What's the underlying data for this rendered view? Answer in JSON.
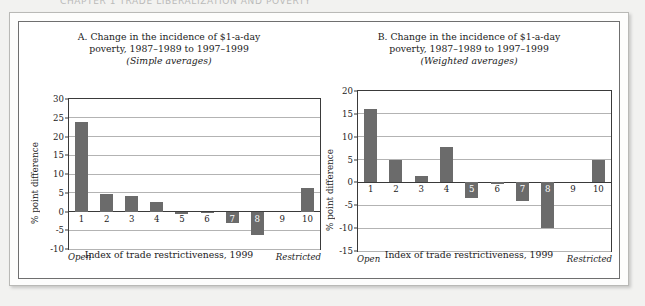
{
  "scan": {
    "cut_off_header": "CHAPTER 1  TRADE LIBERALIZATION AND POVERTY"
  },
  "colors": {
    "bar": "#6b6b6b",
    "axis": "#3a3a3a",
    "grid": "#b3b3b3",
    "text": "#1b1b1b",
    "page_background": "#f2f2f0",
    "panel_background": "#ffffff"
  },
  "panels": [
    {
      "id": "panel-a",
      "title_line1": "A.  Change in the incidence of $1-a-day",
      "title_line2": "poverty, 1987–1989 to 1997–1999",
      "title_line3": "(Simple averages)",
      "xaxis_title": "Index of trade restrictiveness, 1999",
      "left_end_label": "Open",
      "right_end_label": "Restricted"
    },
    {
      "id": "panel-b",
      "title_line1": "B.  Change in the incidence of $1-a-day",
      "title_line2": "poverty, 1987–1989 to 1997–1999",
      "title_line3": "(Weighted averages)",
      "xaxis_title": "Index of trade restrictiveness, 1999",
      "left_end_label": "Open",
      "right_end_label": "Restricted"
    }
  ],
  "chart_data": [
    {
      "type": "bar",
      "id": "chart-a",
      "title": "A. Change in the incidence of $1-a-day poverty, 1987–1989 to 1997–1999 (Simple averages)",
      "subtitle": "(Simple averages)",
      "xlabel": "Index of trade restrictiveness, 1999",
      "ylabel": "% point difference",
      "categories": [
        "1",
        "2",
        "3",
        "4",
        "5",
        "6",
        "7",
        "8",
        "9",
        "10"
      ],
      "values": [
        23.8,
        4.6,
        4.2,
        2.6,
        -0.6,
        -0.2,
        -3.0,
        -6.3,
        0.0,
        6.3
      ],
      "ylim": [
        -10,
        30
      ],
      "yticks": [
        30,
        25,
        20,
        15,
        10,
        5,
        0,
        -5,
        -10
      ],
      "ytick_labels": [
        "30",
        "25",
        "20",
        "15",
        "10",
        "5",
        "0",
        "-5",
        "-10"
      ],
      "grid": true,
      "legend": "none",
      "annotations": {
        "x_axis_left": "Open",
        "x_axis_right": "Restricted"
      }
    },
    {
      "type": "bar",
      "id": "chart-b",
      "title": "B. Change in the incidence of $1-a-day poverty, 1987–1989 to 1997–1999 (Weighted averages)",
      "subtitle": "(Weighted averages)",
      "xlabel": "Index of trade restrictiveness, 1999",
      "ylabel": "% point difference",
      "categories": [
        "1",
        "2",
        "3",
        "4",
        "5",
        "6",
        "7",
        "8",
        "9",
        "10"
      ],
      "values": [
        16.0,
        4.8,
        1.5,
        7.8,
        -3.3,
        -0.3,
        -4.0,
        -10.0,
        0.0,
        4.9
      ],
      "ylim": [
        -15,
        20
      ],
      "yticks": [
        20,
        15,
        10,
        5,
        0,
        -5,
        -10,
        -15
      ],
      "ytick_labels": [
        "20",
        "15",
        "10",
        "5",
        "0",
        "-5",
        "-10",
        "-15"
      ],
      "grid": true,
      "legend": "none",
      "annotations": {
        "x_axis_left": "Open",
        "x_axis_right": "Restricted"
      }
    }
  ]
}
